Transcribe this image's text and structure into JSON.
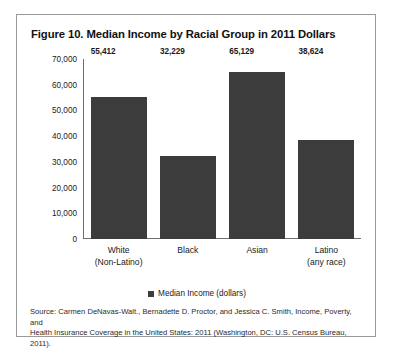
{
  "figure": {
    "title": "Figure 10. Median Income by Racial Group in 2011 Dollars",
    "frame_border_color": "#9a9a9a",
    "background_color": "#ffffff"
  },
  "legend": {
    "label": "Median Income (dollars)",
    "swatch_color": "#3c3c3c",
    "position": "bottom-center"
  },
  "source": {
    "line1": "Source: Carmen DeNavas-Walt., Bernadette D. Proctor, and Jessica C. Smith, Income, Poverty, and",
    "line2": "Health Insurance Coverage in the United States: 2011 (Washington, DC: U.S. Census Bureau, 2011)."
  },
  "axis": {
    "y_ticks": [
      "70,000",
      "60,000",
      "50,000",
      "40,000",
      "30,000",
      "20,000",
      "10,000",
      "0"
    ],
    "x_labels": [
      {
        "main": "White",
        "sub": "(Non-Latino)"
      },
      {
        "main": "Black",
        "sub": ""
      },
      {
        "main": "Asian",
        "sub": ""
      },
      {
        "main": "Latino",
        "sub": "(any race)"
      }
    ]
  },
  "chart_data": {
    "type": "bar",
    "title": "Figure 10. Median Income by Racial Group in 2011 Dollars",
    "categories": [
      "White (Non-Latino)",
      "Black",
      "Asian",
      "Latino (any race)"
    ],
    "values": [
      55412,
      32229,
      65129,
      38624
    ],
    "value_labels": [
      "55,412",
      "32,229",
      "65,129",
      "38,624"
    ],
    "series": [
      {
        "name": "Median Income (dollars)",
        "values": [
          55412,
          32229,
          65129,
          38624
        ],
        "color": "#3c3c3c"
      }
    ],
    "xlabel": "",
    "ylabel": "",
    "ylim": [
      0,
      70000
    ],
    "ytick_step": 10000,
    "grid": false,
    "legend_position": "bottom-center"
  }
}
